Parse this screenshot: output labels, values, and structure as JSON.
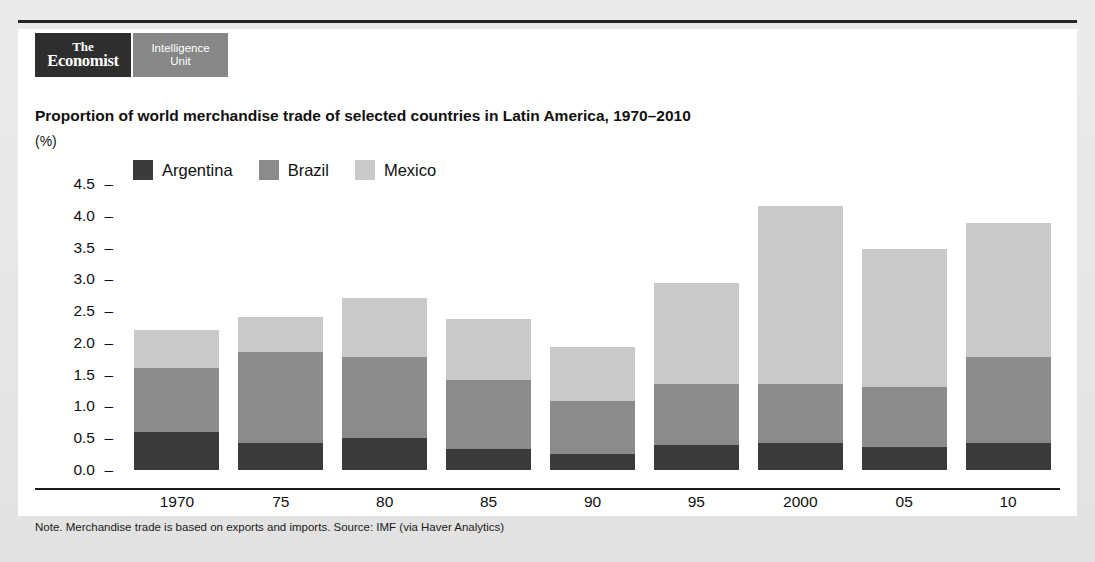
{
  "brand": {
    "economist_line1": "The",
    "economist_line2": "Economist",
    "eiu_line1": "Intelligence",
    "eiu_line2": "Unit"
  },
  "chart_data": {
    "type": "bar",
    "stacked": true,
    "title": "Proportion of world merchandise trade of selected countries in Latin America, 1970–2010",
    "unit_label": "(%)",
    "xlabel": "",
    "ylabel": "",
    "ylim": [
      0.0,
      4.5
    ],
    "ytick_step": 0.5,
    "grid": false,
    "legend_position": "top-left",
    "categories": [
      "1970",
      "75",
      "80",
      "85",
      "90",
      "95",
      "2000",
      "05",
      "10"
    ],
    "ytick_labels": [
      "4.5",
      "4.0",
      "3.5",
      "3.0",
      "2.5",
      "2.0",
      "1.5",
      "1.0",
      "0.5",
      "0.0"
    ],
    "ytick_values": [
      4.5,
      4.0,
      3.5,
      3.0,
      2.5,
      2.0,
      1.5,
      1.0,
      0.5,
      0.0
    ],
    "series": [
      {
        "name": "Argentina",
        "color": "#3b3b3b",
        "values": [
          0.6,
          0.42,
          0.5,
          0.33,
          0.25,
          0.4,
          0.43,
          0.36,
          0.42
        ]
      },
      {
        "name": "Brazil",
        "color": "#8b8b8b",
        "values": [
          1.0,
          1.43,
          1.28,
          1.09,
          0.83,
          0.95,
          0.92,
          0.94,
          1.36
        ]
      },
      {
        "name": "Mexico",
        "color": "#c9c9c9",
        "values": [
          0.6,
          0.55,
          0.92,
          0.96,
          0.85,
          1.6,
          2.8,
          2.17,
          2.1
        ]
      }
    ],
    "totals": [
      2.2,
      2.4,
      2.7,
      2.38,
      1.93,
      2.95,
      4.15,
      3.47,
      3.88
    ],
    "note": "Note. Merchandise trade is based on exports and imports.",
    "source": "Source: IMF (via Haver Analytics)"
  },
  "footnote": "Note. Merchandise trade is based on exports and imports.  Source: IMF (via Haver Analytics)"
}
